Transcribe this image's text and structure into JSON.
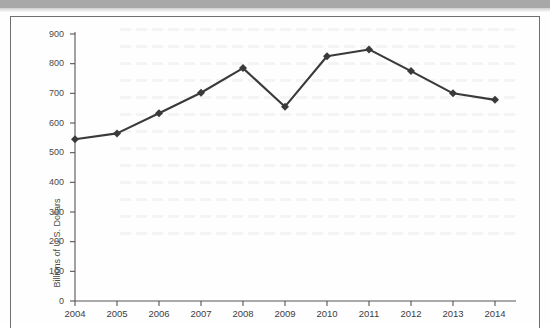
{
  "document": {
    "header_bar_color": "#a8a8a8",
    "frame_border_color": "#6f6f6f",
    "background_color": "#fefefe"
  },
  "chart_data": {
    "type": "line",
    "title": "",
    "xlabel": "",
    "ylabel": "Billions of U.S. Dollars",
    "categories": [
      "2004",
      "2005",
      "2006",
      "2007",
      "2008",
      "2009",
      "2010",
      "2011",
      "2012",
      "2013",
      "2014"
    ],
    "values": [
      545,
      565,
      633,
      702,
      785,
      655,
      825,
      848,
      775,
      700,
      678
    ],
    "series": [
      {
        "name": "Billions of U.S. Dollars",
        "values": [
          545,
          565,
          633,
          702,
          785,
          655,
          825,
          848,
          775,
          700,
          678
        ]
      }
    ],
    "ylim": [
      0,
      900
    ],
    "ytick_labels": [
      "900",
      "800",
      "700",
      "600",
      "500",
      "400",
      "300",
      "200",
      "100",
      "0"
    ],
    "ytick_values": [
      900,
      800,
      700,
      600,
      500,
      400,
      300,
      200,
      100,
      0
    ],
    "xtick_labels": [
      "2004",
      "2005",
      "2006",
      "2007",
      "2008",
      "2009",
      "2010",
      "2011",
      "2012",
      "2013",
      "2014"
    ],
    "grid": false,
    "legend": "none",
    "line_color": "#3a3a3a",
    "marker": "diamond",
    "marker_color": "#3a3a3a",
    "axis_color": "#555555"
  }
}
